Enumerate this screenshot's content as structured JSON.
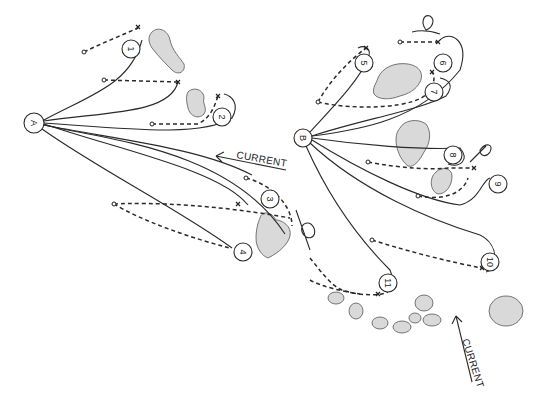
{
  "diagram": {
    "type": "casting-positions-sketch",
    "anchors": [
      {
        "id": "A",
        "label": "A",
        "x": 34,
        "y": 123
      },
      {
        "id": "B",
        "label": "B",
        "x": 303,
        "y": 138
      }
    ],
    "positions": [
      {
        "label": "1",
        "x": 131,
        "y": 49
      },
      {
        "label": "2",
        "x": 222,
        "y": 117
      },
      {
        "label": "3",
        "x": 270,
        "y": 199
      },
      {
        "label": "4",
        "x": 243,
        "y": 252
      },
      {
        "label": "5",
        "x": 364,
        "y": 63
      },
      {
        "label": "6",
        "x": 443,
        "y": 63
      },
      {
        "label": "7",
        "x": 434,
        "y": 92
      },
      {
        "label": "8",
        "x": 453,
        "y": 155
      },
      {
        "label": "9",
        "x": 498,
        "y": 184
      },
      {
        "label": "10",
        "x": 490,
        "y": 262
      },
      {
        "label": "11",
        "x": 388,
        "y": 283
      }
    ],
    "current_labels": [
      {
        "text": "CURRENT",
        "x": 236,
        "y": 158,
        "rotate": 10
      },
      {
        "text": "CURRENT",
        "x": 462,
        "y": 340,
        "rotate": 72
      }
    ]
  }
}
